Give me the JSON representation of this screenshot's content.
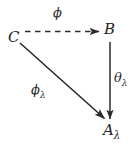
{
  "diagram": {
    "type": "commutative-diagram",
    "background_color": "#ffffff",
    "ink_color": "#2b2b2b",
    "nodes": [
      {
        "id": "C",
        "label": "C",
        "x": 15,
        "y": 37
      },
      {
        "id": "B",
        "label": "B",
        "x": 110,
        "y": 29
      },
      {
        "id": "A_lambda",
        "base": "A",
        "subscript": "λ",
        "x": 112,
        "y": 130
      }
    ],
    "edges": [
      {
        "id": "phi",
        "from": "C",
        "to": "B",
        "style": "dashed",
        "arrowhead": "filled",
        "label_base": "ϕ",
        "label_subscript": "",
        "label_position": "above"
      },
      {
        "id": "phi_lambda",
        "from": "C",
        "to": "A_lambda",
        "style": "solid",
        "arrowhead": "filled",
        "label_base": "ϕ",
        "label_subscript": "λ",
        "label_position": "left"
      },
      {
        "id": "theta_lambda",
        "from": "B",
        "to": "A_lambda",
        "style": "solid",
        "arrowhead": "filled",
        "label_base": "θ",
        "label_subscript": "λ",
        "label_position": "right"
      }
    ]
  }
}
